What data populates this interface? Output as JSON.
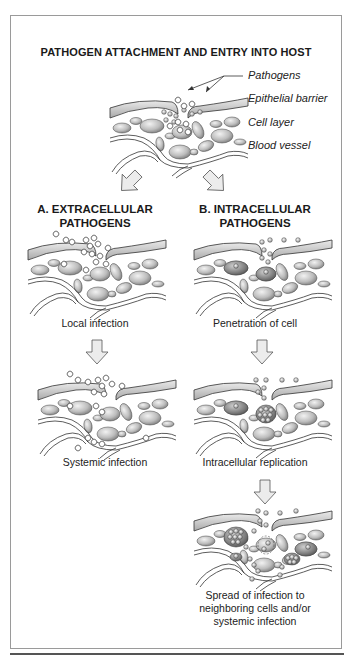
{
  "figure": {
    "title": "PATHOGEN ATTACHMENT AND ENTRY INTO HOST",
    "legend": {
      "pathogens": "Pathogens",
      "epithelial_barrier": "Epithelial barrier",
      "cell_layer": "Cell layer",
      "blood_vessel": "Blood vessel"
    },
    "section_a": {
      "heading_line1": "A.  EXTRACELLULAR",
      "heading_line2": "PATHOGENS",
      "steps": [
        {
          "caption": "Local infection"
        },
        {
          "caption": "Systemic infection"
        }
      ]
    },
    "section_b": {
      "heading_line1": "B.  INTRACELLULAR",
      "heading_line2": "PATHOGENS",
      "steps": [
        {
          "caption": "Penetration of cell"
        },
        {
          "caption": "Intracellular replication"
        },
        {
          "caption_line1": "Spread of infection to",
          "caption_line2": "neighboring cells and/or",
          "caption_line3": "systemic infection"
        }
      ]
    },
    "colors": {
      "outline": "#333333",
      "cell_fill": "#c8c8c8",
      "cell_shadow": "#8a8a8a",
      "arrow_fill": "#e6e6e6",
      "frame": "#9a9a9a"
    }
  }
}
